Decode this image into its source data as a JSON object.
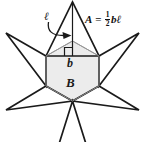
{
  "figure": {
    "formula": {
      "variable": "A",
      "equals": "=",
      "numerator": "1",
      "denominator": "2",
      "factors": "bℓ"
    },
    "labels": {
      "slant_height": "ℓ",
      "base": "b",
      "hexagon": "B"
    },
    "colors": {
      "stroke": "#1a1a1a",
      "hexagon_fill": "#ececec",
      "hexagon_stroke": "#8a8a8a",
      "background": "#ffffff",
      "text": "#111111"
    },
    "icons": {
      "right_angle": "right-angle-marker",
      "pointer": "curved-arrow"
    }
  }
}
